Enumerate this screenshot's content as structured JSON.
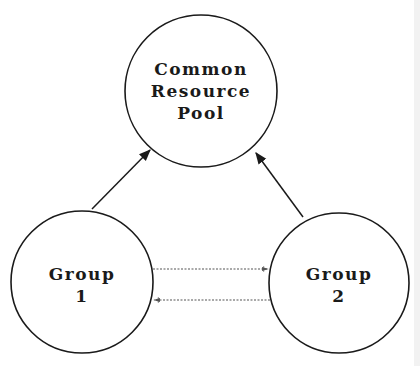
{
  "diagram": {
    "nodes": {
      "pool": {
        "lines": [
          "Common",
          "Resource",
          "Pool"
        ]
      },
      "group1": {
        "lines": [
          "Group",
          "1"
        ]
      },
      "group2": {
        "lines": [
          "Group",
          "2"
        ]
      }
    },
    "edges": [
      {
        "from": "group1",
        "to": "pool",
        "style": "solid"
      },
      {
        "from": "group2",
        "to": "pool",
        "style": "solid"
      },
      {
        "from": "group1",
        "to": "group2",
        "style": "dashed"
      },
      {
        "from": "group2",
        "to": "group1",
        "style": "dashed"
      }
    ]
  }
}
